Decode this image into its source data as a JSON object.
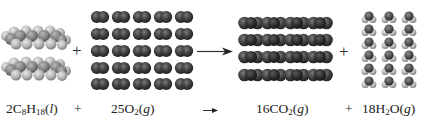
{
  "equation": {
    "reactant1": {
      "coef": "2",
      "formula_parts": [
        "C",
        "8",
        "H",
        "18"
      ],
      "state": "l",
      "label": "2C8H18(l)"
    },
    "plus1": "+",
    "reactant2": {
      "coef": "25",
      "formula_parts": [
        "O",
        "2"
      ],
      "state": "g",
      "label": "25O2(g)"
    },
    "arrow": "→",
    "product1": {
      "coef": "16",
      "formula_parts": [
        "CO",
        "2"
      ],
      "state": "g",
      "label": "16CO2(g)"
    },
    "plus2": "+",
    "product2": {
      "coef": "18",
      "formula_parts": [
        "H",
        "2",
        "O"
      ],
      "state": "g",
      "label": "18H2O(g)"
    }
  },
  "models": {
    "octane": {
      "count": 2,
      "rows": 2,
      "name": "octane-space-filling"
    },
    "oxygen": {
      "count": 25,
      "rows": 5,
      "cols": 5,
      "name": "O2-space-filling"
    },
    "carbon_dioxide": {
      "count": 16,
      "rows": 4,
      "cols": 4,
      "name": "CO2-space-filling"
    },
    "water": {
      "count": 18,
      "rows": 6,
      "cols": 3,
      "name": "H2O-space-filling"
    }
  },
  "model_plus1": "+",
  "model_plus2": "+",
  "colors": {
    "carbon_gray": "#8a8a8a",
    "hydrogen_light": "#c4c4c4",
    "oxygen_dark": "#3a3a3a",
    "text": "#222222"
  }
}
